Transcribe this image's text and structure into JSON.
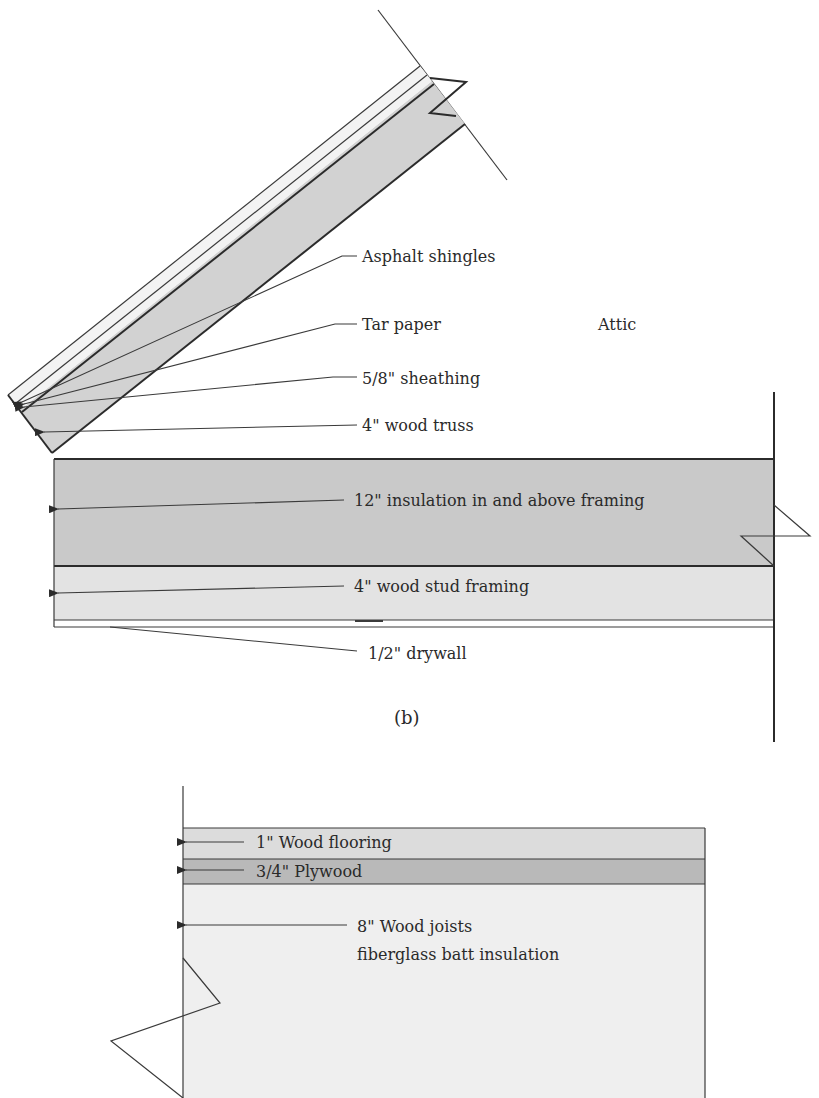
{
  "figure": {
    "caption": "(b)",
    "region_label": "Attic",
    "colors": {
      "background": "#ffffff",
      "insulation_dark": "#c9c9c9",
      "truss_gray": "#d2d2d2",
      "stud_light": "#e3e3e3",
      "flooring": "#dcdcdc",
      "plywood": "#b9b9b9",
      "joists": "#efefef",
      "line": "#2b2b2b"
    }
  },
  "roof_assembly": {
    "labels": [
      {
        "text": "Asphalt shingles"
      },
      {
        "text": "Tar paper"
      },
      {
        "text": "5/8\" sheathing"
      },
      {
        "text": "4\" wood truss"
      }
    ]
  },
  "ceiling_assembly": {
    "labels": [
      {
        "text": "12\" insulation in and above framing"
      },
      {
        "text": "4\" wood stud framing"
      },
      {
        "text": "1/2\" drywall"
      }
    ]
  },
  "floor_assembly": {
    "labels": [
      {
        "text": "1\" Wood flooring"
      },
      {
        "text": "3/4\" Plywood"
      },
      {
        "text": "8\" Wood joists"
      },
      {
        "text": "fiberglass batt insulation"
      }
    ]
  }
}
